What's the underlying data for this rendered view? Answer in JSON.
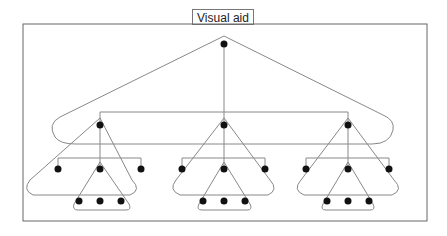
{
  "title": "Visual aid",
  "diagram": {
    "type": "tree",
    "levels": 4,
    "root": {
      "children": [
        {
          "children": [
            {},
            {
              "children": [
                {},
                {},
                {}
              ]
            },
            {}
          ]
        },
        {
          "children": [
            {},
            {
              "children": [
                {},
                {},
                {}
              ]
            },
            {}
          ]
        },
        {
          "children": [
            {},
            {
              "children": [
                {},
                {},
                {}
              ]
            },
            {}
          ]
        }
      ]
    },
    "colors": {
      "node": "#111111",
      "edge": "#888888",
      "frame": "#666666"
    }
  }
}
